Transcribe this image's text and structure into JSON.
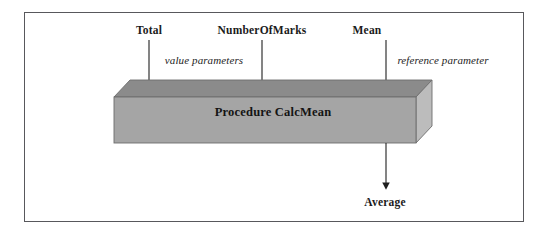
{
  "diagram": {
    "box_label": "Procedure CalcMean",
    "inputs": [
      {
        "name": "Total",
        "kind": "value parameter"
      },
      {
        "name": "NumberOfMarks",
        "kind": "value parameter"
      },
      {
        "name": "Mean",
        "kind": "reference parameter"
      }
    ],
    "annotations": {
      "value_parameters": "value parameters",
      "reference_parameter": "reference parameter"
    },
    "output": {
      "label": "Average"
    },
    "colors": {
      "frame_border": "#58585c",
      "box_front": "#a5a5a5",
      "box_top": "#8b8b8b",
      "box_side": "#bcbcbc",
      "box_outline": "#6d6d6d",
      "arrow": "#1f1f1f",
      "text": "#1b1b1b",
      "background": "#ffffff"
    }
  }
}
